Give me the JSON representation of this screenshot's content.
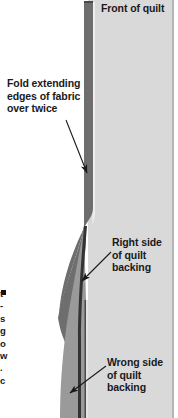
{
  "figure": {
    "kind": "quilt-binding-cross-section-diagram",
    "background": "#ffffff"
  },
  "colors": {
    "quilt_front_fill": "#d9d9d9",
    "quilt_front_edge": "#a8a8a8",
    "fold_dark": "#6e6e6e",
    "fold_dark_edge": "#4a4a4a",
    "wedge_mid": "#9a9a9a",
    "line_dark": "#333333",
    "text": "#1a1a1a",
    "leader": "#1a1a1a"
  },
  "labels": {
    "front_of_quilt": "Front of quilt",
    "fold_extending_line1": "Fold extending",
    "fold_extending_line2": "edges of fabric",
    "fold_extending_line3": "over twice",
    "right_side_line1": "Right side",
    "right_side_line2": "of quilt",
    "right_side_line3": "backing",
    "wrong_side_line1": "Wrong side",
    "wrong_side_line2": "of quilt",
    "wrong_side_line3": "backing"
  },
  "clipped_margin_text": {
    "note": "text column cut off at left page edge - only letter stubs visible",
    "fragments": [
      "t",
      "-",
      "s",
      "g",
      "o",
      "w",
      ".",
      "c"
    ]
  },
  "leaders": [
    {
      "name": "fold-leader",
      "from": [
        66,
        120
      ],
      "to": [
        87,
        174
      ]
    },
    {
      "name": "right-side-leader",
      "from": [
        110,
        252
      ],
      "to": [
        81,
        281
      ]
    },
    {
      "name": "wrong-side-leader",
      "from": [
        105,
        366
      ],
      "to": [
        70,
        393
      ]
    }
  ]
}
